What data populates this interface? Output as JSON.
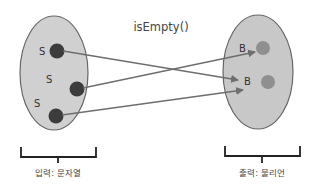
{
  "diagram": {
    "function_label": "isEmpty()",
    "input_set": {
      "caption": "입력: 문자열",
      "fill": "#d0d0d0",
      "stroke": "#666666",
      "elements": [
        {
          "label": "S",
          "dot_color": "#3c3c3c"
        },
        {
          "label": "S",
          "dot_color": "#3c3c3c"
        },
        {
          "label": "S",
          "dot_color": "#3c3c3c"
        }
      ]
    },
    "output_set": {
      "caption": "출력: 불리언",
      "fill": "#c8c8c8",
      "stroke": "#666666",
      "elements": [
        {
          "label": "B",
          "dot_color": "#8f8f8f"
        },
        {
          "label": "B",
          "dot_color": "#8f8f8f"
        }
      ]
    },
    "mappings": [
      {
        "from": 0,
        "to": 1
      },
      {
        "from": 1,
        "to": 0
      },
      {
        "from": 2,
        "to": 1
      }
    ],
    "arrow_color": "#6e6e6e"
  }
}
